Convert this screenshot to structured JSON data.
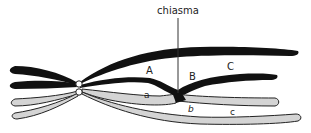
{
  "diagram": {
    "title_label": "chiasma",
    "labels": {
      "A": "A",
      "B": "B",
      "C": "C",
      "a": "a",
      "b": "b",
      "c": "c"
    },
    "colors": {
      "dark_chromatid": "#111111",
      "light_chromatid": "#d4d4d4",
      "outline": "#222222",
      "centromere": "#ffffff"
    }
  }
}
